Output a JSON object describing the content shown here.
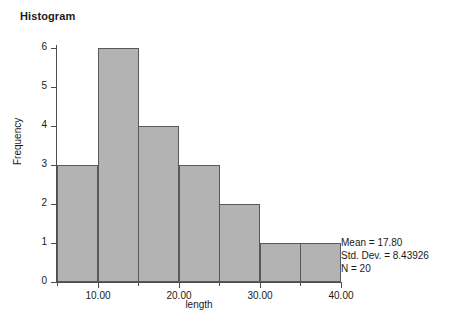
{
  "chart_data": {
    "type": "bar",
    "title": "Histogram",
    "xlabel": "length",
    "ylabel": "Frequency",
    "bin_width": 5,
    "bin_starts": [
      5,
      10,
      15,
      20,
      25,
      30,
      35
    ],
    "bin_ends": [
      10,
      15,
      20,
      25,
      30,
      35,
      40
    ],
    "categories": [
      "5-10",
      "10-15",
      "15-20",
      "20-25",
      "25-30",
      "30-35",
      "35-40"
    ],
    "values": [
      3,
      6,
      4,
      3,
      2,
      1,
      1
    ],
    "xlim": [
      5,
      40
    ],
    "ylim": [
      0,
      6
    ],
    "x_ticks": [
      10,
      20,
      30,
      40
    ],
    "x_tick_labels": [
      "10.00",
      "20.00",
      "30.00",
      "40.00"
    ],
    "x_minor_ticks": [
      5,
      15,
      25,
      35
    ],
    "y_ticks": [
      0,
      1,
      2,
      3,
      4,
      5,
      6
    ],
    "y_tick_labels": [
      "0",
      "1",
      "2",
      "3",
      "4",
      "5",
      "6"
    ],
    "grid": false,
    "legend": null,
    "annotations": [
      "Mean = 17.80",
      "Std. Dev. = 8.43926",
      "N = 20"
    ],
    "colors": {
      "bar_fill": "#b3b3b3",
      "bar_border": "#595959",
      "axis": "#4d4d4d",
      "text": "#1a1a1a",
      "background": "#ffffff"
    }
  },
  "chart": {
    "title": "Histogram",
    "axis_x_title": "length",
    "axis_y_title": "Frequency"
  },
  "stats": {
    "mean": "Mean = 17.80",
    "std_dev": "Std. Dev. = 8.43926",
    "n": "N = 20"
  },
  "y_axis": {
    "labels": [
      "6",
      "5",
      "4",
      "3",
      "2",
      "1",
      "0"
    ]
  },
  "x_axis": {
    "labels": [
      "10.00",
      "20.00",
      "30.00",
      "40.00"
    ]
  }
}
